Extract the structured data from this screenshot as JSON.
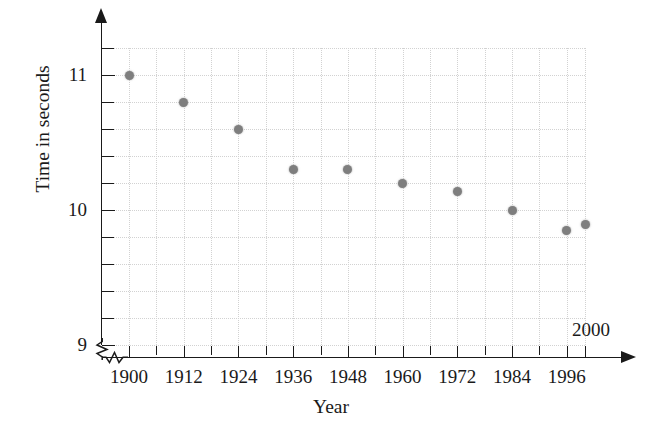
{
  "chart_data": {
    "type": "scatter",
    "title": "",
    "xlabel": "Year",
    "ylabel": "Time in seconds",
    "xlim": [
      1900,
      2000
    ],
    "ylim": [
      9.0,
      11.2
    ],
    "grid": true,
    "legend_position": "none",
    "x_tick_labels": [
      "1900",
      "1912",
      "1924",
      "1936",
      "1948",
      "1960",
      "1972",
      "1984",
      "1996",
      "2000"
    ],
    "x_tick_values": [
      1900,
      1912,
      1924,
      1936,
      1948,
      1960,
      1972,
      1984,
      1996,
      2000
    ],
    "x_minor_tick_values": [
      1906,
      1918,
      1930,
      1942,
      1954,
      1966,
      1978,
      1990
    ],
    "y_tick_labels": [
      "11",
      "10",
      "9"
    ],
    "y_tick_values": [
      11,
      10,
      9
    ],
    "y_minor_tick_values": [
      11.2,
      10.8,
      10.6,
      10.4,
      10.2,
      9.8,
      9.6,
      9.4,
      9.2
    ],
    "y_all_tick_values": [
      11.2,
      11.0,
      10.8,
      10.6,
      10.4,
      10.2,
      10.0,
      9.8,
      9.6,
      9.4,
      9.2,
      9.0
    ],
    "axis_break_x": true,
    "axis_break_y": true,
    "point_color": "#7e7e7e",
    "grid_color": "#d2d2d2",
    "axis_color": "#1a1a1a",
    "x": [
      1900,
      1912,
      1924,
      1936,
      1948,
      1960,
      1972,
      1984,
      1996,
      2000
    ],
    "y": [
      11.0,
      10.8,
      10.6,
      10.3,
      10.3,
      10.2,
      10.14,
      10.0,
      9.85,
      9.89
    ],
    "points": [
      {
        "x": 1900,
        "y": 11.0
      },
      {
        "x": 1912,
        "y": 10.8
      },
      {
        "x": 1924,
        "y": 10.6
      },
      {
        "x": 1936,
        "y": 10.3
      },
      {
        "x": 1948,
        "y": 10.3
      },
      {
        "x": 1960,
        "y": 10.2
      },
      {
        "x": 1972,
        "y": 10.14
      },
      {
        "x": 1984,
        "y": 10.0
      },
      {
        "x": 1996,
        "y": 9.85
      },
      {
        "x": 2000,
        "y": 9.89
      }
    ]
  },
  "axis": {
    "x_title": "Year",
    "y_title": "Time in seconds",
    "x_labels": [
      {
        "text": "1900",
        "value": 1900
      },
      {
        "text": "1912",
        "value": 1912
      },
      {
        "text": "1924",
        "value": 1924
      },
      {
        "text": "1936",
        "value": 1936
      },
      {
        "text": "1948",
        "value": 1948
      },
      {
        "text": "1960",
        "value": 1960
      },
      {
        "text": "1972",
        "value": 1972
      },
      {
        "text": "1984",
        "value": 1984
      },
      {
        "text": "1996",
        "value": 1996
      },
      {
        "text": "2000",
        "value": 2000
      }
    ],
    "y_labels": [
      {
        "text": "11",
        "value": 11
      },
      {
        "text": "10",
        "value": 10
      },
      {
        "text": "9",
        "value": 9
      }
    ]
  }
}
